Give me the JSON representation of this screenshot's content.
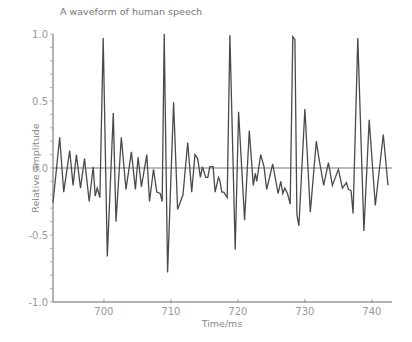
{
  "chart_data": {
    "type": "line",
    "title": "A waveform of human speech",
    "xlabel": "Time/ms",
    "ylabel": "Relative amplitude",
    "xlim": [
      692.4,
      743.0
    ],
    "ylim": [
      -1.0,
      1.0
    ],
    "x_ticks": [
      700,
      710,
      720,
      730,
      740
    ],
    "x_tick_labels": [
      "700",
      "710",
      "720",
      "730",
      "740"
    ],
    "y_ticks": [
      -1.0,
      -0.5,
      0.0,
      0.5,
      1.0
    ],
    "y_tick_labels": [
      "-1.0",
      "-0.5",
      "0.0",
      "0.5",
      "1.0"
    ],
    "y_minor_step": 0.1,
    "grid": false,
    "zero_line": true,
    "legend": null,
    "series": [
      {
        "name": "speech waveform",
        "color": "#4a4a4a",
        "x": [
          692.4,
          693.4,
          694.0,
          694.9,
          695.4,
          695.9,
          696.5,
          697.1,
          697.8,
          698.4,
          698.7,
          699.0,
          699.4,
          699.9,
          700.5,
          701.4,
          701.8,
          702.6,
          703.3,
          704.1,
          704.7,
          705.1,
          705.6,
          706.4,
          706.8,
          707.4,
          707.9,
          708.4,
          708.7,
          709.0,
          709.5,
          710.4,
          711.0,
          711.8,
          712.5,
          713.1,
          713.6,
          714.0,
          714.4,
          714.7,
          715.2,
          715.5,
          715.8,
          716.3,
          716.6,
          717.1,
          717.3,
          717.6,
          717.9,
          718.4,
          718.8,
          719.6,
          720.1,
          721.0,
          721.7,
          722.3,
          722.6,
          722.8,
          723.4,
          723.9,
          724.3,
          725.2,
          726.0,
          726.4,
          726.7,
          727.0,
          727.4,
          727.8,
          728.2,
          728.5,
          728.8,
          729.1,
          730.0,
          730.8,
          731.7,
          732.1,
          732.8,
          733.5,
          734.1,
          735.0,
          735.6,
          736.2,
          736.5,
          736.9,
          737.2,
          737.9,
          738.8,
          739.6,
          740.5,
          741.7,
          742.4
        ],
        "y": [
          -0.26,
          0.23,
          -0.18,
          0.13,
          -0.13,
          0.1,
          -0.15,
          0.07,
          -0.25,
          0.01,
          -0.21,
          -0.15,
          -0.22,
          0.97,
          -0.66,
          0.41,
          -0.4,
          0.23,
          -0.16,
          0.12,
          -0.16,
          0.08,
          -0.14,
          0.1,
          -0.25,
          -0.01,
          -0.18,
          -0.19,
          -0.25,
          1.0,
          -0.78,
          0.49,
          -0.31,
          -0.2,
          0.19,
          -0.18,
          0.1,
          0.07,
          -0.07,
          0.01,
          -0.07,
          -0.07,
          0.01,
          0.01,
          -0.18,
          -0.07,
          -0.09,
          -0.18,
          -0.18,
          -0.22,
          0.99,
          -0.61,
          0.42,
          -0.39,
          0.28,
          -0.13,
          -0.04,
          -0.1,
          0.1,
          0.01,
          -0.16,
          0.03,
          -0.19,
          -0.1,
          -0.19,
          -0.15,
          -0.19,
          -0.27,
          0.98,
          0.96,
          -0.35,
          -0.43,
          0.44,
          -0.33,
          0.2,
          0.07,
          -0.13,
          0.04,
          -0.13,
          -0.01,
          -0.15,
          -0.11,
          -0.16,
          -0.17,
          -0.34,
          0.97,
          -0.47,
          0.36,
          -0.28,
          0.25,
          -0.13
        ]
      }
    ]
  },
  "plot_area": {
    "left_px": 53,
    "right_px": 392,
    "top_px": 34,
    "bottom_px": 302
  }
}
